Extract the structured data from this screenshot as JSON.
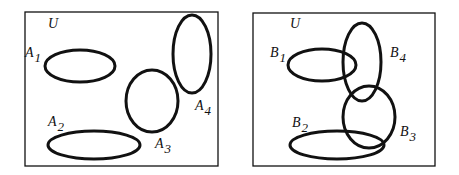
{
  "diagram": {
    "type": "venn-diagrams",
    "stroke_color": "#111111",
    "panels": [
      {
        "id": "left",
        "universe_label": "U",
        "frame": {
          "x": 25,
          "y": 12,
          "w": 193,
          "h": 154
        },
        "universe_pos": {
          "x": 48,
          "y": 28
        },
        "sets": [
          {
            "letter": "A",
            "sub": "1",
            "cx": 80,
            "cy": 66,
            "rx": 35,
            "ry": 16,
            "lx": 25,
            "ly": 57
          },
          {
            "letter": "A",
            "sub": "2",
            "cx": 94,
            "cy": 145,
            "rx": 46,
            "ry": 14,
            "lx": 48,
            "ly": 126
          },
          {
            "letter": "A",
            "sub": "3",
            "cx": 152,
            "cy": 101,
            "rx": 26,
            "ry": 31,
            "lx": 155,
            "ly": 148
          },
          {
            "letter": "A",
            "sub": "4",
            "cx": 192,
            "cy": 54,
            "rx": 19,
            "ry": 39,
            "lx": 195,
            "ly": 110
          }
        ]
      },
      {
        "id": "right",
        "universe_label": "U",
        "frame": {
          "x": 253,
          "y": 13,
          "w": 182,
          "h": 153
        },
        "universe_pos": {
          "x": 290,
          "y": 28
        },
        "sets": [
          {
            "letter": "B",
            "sub": "1",
            "cx": 322,
            "cy": 65,
            "rx": 34,
            "ry": 16,
            "lx": 270,
            "ly": 57
          },
          {
            "letter": "B",
            "sub": "2",
            "cx": 337,
            "cy": 145,
            "rx": 47,
            "ry": 14,
            "lx": 292,
            "ly": 127
          },
          {
            "letter": "B",
            "sub": "3",
            "cx": 369,
            "cy": 117,
            "rx": 26,
            "ry": 31,
            "lx": 400,
            "ly": 136
          },
          {
            "letter": "B",
            "sub": "4",
            "cx": 362,
            "cy": 62,
            "rx": 19,
            "ry": 39,
            "lx": 390,
            "ly": 57
          }
        ]
      }
    ]
  }
}
